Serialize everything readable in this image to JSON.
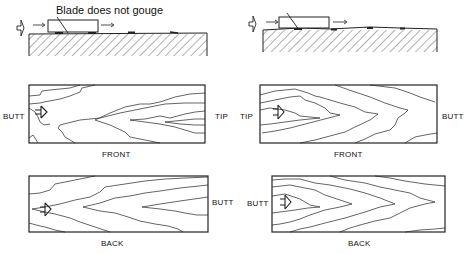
{
  "panels": {
    "top_left": {
      "caption": "Blade does not gouge"
    },
    "mid_left": {
      "left_label": "BUTT",
      "right_label": "TIP",
      "caption": "FRONT"
    },
    "mid_right": {
      "left_label": "TIP",
      "right_label": "BUTT",
      "caption": "FRONT"
    },
    "bottom_left": {
      "right_label": "BUTT",
      "caption": "BACK"
    },
    "bottom_right": {
      "left_label": "BUTT",
      "caption": "BACK"
    }
  },
  "colors": {
    "line": "#1a1a1a",
    "background": "#ffffff"
  }
}
